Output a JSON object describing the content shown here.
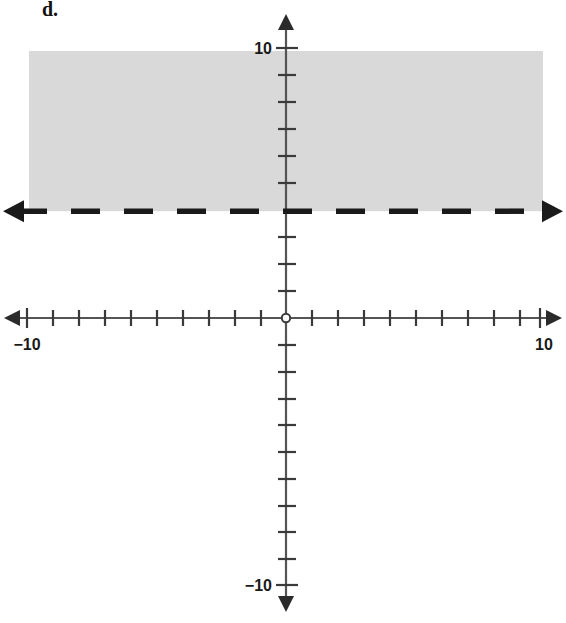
{
  "figure": {
    "label": "d."
  },
  "chart_data": {
    "type": "line",
    "title": "d.",
    "xlabel": "",
    "ylabel": "",
    "xlim": [
      -10,
      10
    ],
    "ylim": [
      -10,
      10
    ],
    "grid": false,
    "legend": "none",
    "x_axis": {
      "tick_labels": [
        "-10",
        "10"
      ],
      "tick_label_values": [
        -10,
        10
      ],
      "tick_values": [
        -10,
        -9,
        -8,
        -7,
        -6,
        -5,
        -4,
        -3,
        -2,
        -1,
        0,
        1,
        2,
        3,
        4,
        5,
        6,
        7,
        8,
        9,
        10
      ],
      "arrows": "both"
    },
    "y_axis": {
      "tick_labels": [
        "10",
        "-10"
      ],
      "tick_label_values": [
        10,
        -10
      ],
      "tick_values": [
        -10,
        -9,
        -8,
        -7,
        -6,
        -5,
        -4,
        -3,
        -2,
        -1,
        0,
        1,
        2,
        3,
        4,
        5,
        6,
        7,
        8,
        9,
        10
      ],
      "arrows": "both"
    },
    "origin_marker": "open-circle",
    "boundary_line": {
      "equation": "y = 4",
      "style": "dashed",
      "slope": 0,
      "intercept": 4,
      "arrows": "both",
      "color": "#1a1a1a"
    },
    "shaded_region": {
      "inequality": "y > 4",
      "region": "above",
      "y_from": 4,
      "y_to": 10,
      "x_from": -10,
      "x_to": 10,
      "color": "#d9d9d9"
    }
  },
  "colors": {
    "axis": "#555555",
    "ink": "#1a1a1a",
    "shade": "#d9d9d9",
    "background": "#ffffff"
  }
}
